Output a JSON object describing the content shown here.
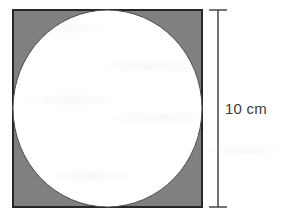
{
  "figure": {
    "kind": "inscribed-circle-in-square",
    "background_color": "#ffffff",
    "square": {
      "name": "shaded square",
      "fill_color": "#808080",
      "stroke_color": "#262626",
      "stroke_width": 2,
      "x": 13,
      "y": 10,
      "width": 189,
      "height": 197
    },
    "circle": {
      "name": "inscribed white circle",
      "fill_color": "#ffffff",
      "stroke_color": "#4d4d4d",
      "stroke_width": 1,
      "cx": 107.5,
      "cy": 108.5,
      "rx": 94.5,
      "ry": 98.5
    },
    "dimension": {
      "name": "vertical side dimension",
      "label": "10 cm",
      "value": 10,
      "unit": "cm",
      "color": "#3a3a3a",
      "line_x": 218,
      "line_top": 10,
      "line_bottom": 207,
      "tick_left": 209,
      "tick_right": 227,
      "orientation": "vertical"
    }
  }
}
